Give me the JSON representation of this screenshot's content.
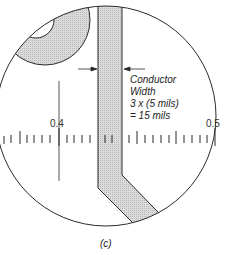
{
  "figure": {
    "caption": "(c)",
    "annotation": {
      "line1": "Conductor",
      "line2": "Width",
      "line3": "3 x (5 mils)",
      "line4": "= 15 mils"
    },
    "scale": {
      "label_left": "0.4",
      "label_right": "0.5"
    },
    "colors": {
      "outline": "#2a2a2a",
      "hatch_fill": "#d4d4d4",
      "background": "#ffffff"
    }
  }
}
